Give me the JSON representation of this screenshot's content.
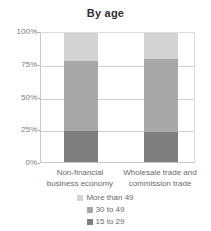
{
  "chart_data": {
    "type": "bar",
    "title": "By age",
    "subtitle": "",
    "xlabel": "",
    "ylabel": "",
    "stacked": true,
    "normalized_percent": true,
    "grid": true,
    "legend_position": "bottom",
    "ylim": [
      0,
      100
    ],
    "yticks": [
      "0%",
      "25%",
      "50%",
      "75%",
      "100%"
    ],
    "ytick_values": [
      0,
      25,
      50,
      75,
      100
    ],
    "categories": [
      "Non-financial business economy",
      "Wholesale trade and commission trade"
    ],
    "category_lines": [
      [
        "Non-financial",
        "business economy"
      ],
      [
        "Wholesale trade and",
        "commission trade"
      ]
    ],
    "series": [
      {
        "name": "More than 49",
        "color": "#d3d3d3",
        "values": [
          22,
          20
        ]
      },
      {
        "name": "30 to 49",
        "color": "#a8a8a8",
        "values": [
          54,
          57
        ]
      },
      {
        "name": "15 to 29",
        "color": "#7f7f7f",
        "values": [
          24,
          23
        ]
      }
    ]
  },
  "legend": {
    "items": [
      {
        "label": "More than 49",
        "color": "#d3d3d3"
      },
      {
        "label": "30 to 49",
        "color": "#a8a8a8"
      },
      {
        "label": "15 to 29",
        "color": "#7f7f7f"
      }
    ]
  },
  "colors": {
    "background": "#ffffff",
    "grid": "#cfcfcf",
    "axis": "#c9c9c9",
    "title_text": "#2f2f2f",
    "label_text": "#6a6a6a",
    "tick_text": "#7d7d7d"
  }
}
